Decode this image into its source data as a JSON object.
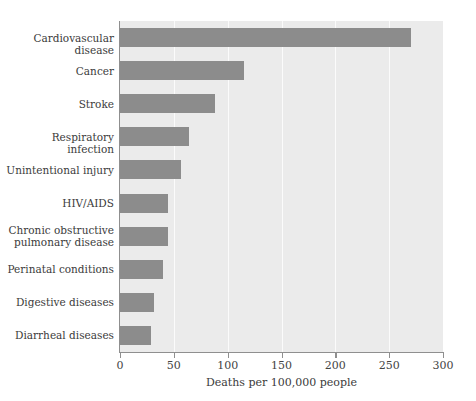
{
  "chart_data": {
    "type": "bar",
    "orientation": "horizontal",
    "title": "",
    "xlabel": "Deaths per 100,000 people",
    "ylabel": "",
    "xlim": [
      0,
      300
    ],
    "xticks": [
      0,
      50,
      100,
      150,
      200,
      250,
      300
    ],
    "xtick_labels": [
      "0",
      "50",
      "100",
      "150",
      "200",
      "250",
      "300"
    ],
    "grid": "vertical",
    "legend": "none",
    "categories": [
      "Cardiovascular disease",
      "Cancer",
      "Stroke",
      "Respiratory infection",
      "Unintentional injury",
      "HIV/AIDS",
      "Chronic obstructive pulmonary disease",
      "Perinatal conditions",
      "Digestive diseases",
      "Diarrheal diseases"
    ],
    "category_labels": [
      [
        "Cardiovascular disease"
      ],
      [
        "Cancer"
      ],
      [
        "Stroke"
      ],
      [
        "Respiratory infection"
      ],
      [
        "Unintentional injury"
      ],
      [
        "HIV/AIDS"
      ],
      [
        "Chronic obstructive",
        "pulmonary disease"
      ],
      [
        "Perinatal conditions"
      ],
      [
        "Digestive diseases"
      ],
      [
        "Diarrheal diseases"
      ]
    ],
    "values": [
      270,
      115,
      88,
      64,
      57,
      45,
      45,
      40,
      32,
      29
    ],
    "colors": {
      "bar": "#8c8c8c",
      "plot_background": "#ebebeb",
      "figure_background": "#ffffff",
      "gridline": "#fbfbfb",
      "axis": "#8f8f8f",
      "text": "#3b3b3b"
    }
  }
}
